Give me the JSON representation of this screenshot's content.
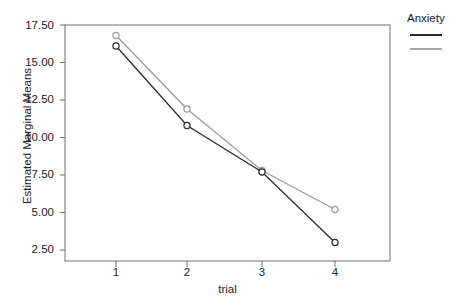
{
  "chart_data": {
    "type": "line",
    "title": "",
    "xlabel": "trial",
    "ylabel": "Estimated Marginal Means",
    "categories": [
      "1",
      "2",
      "3",
      "4"
    ],
    "x": [
      1,
      2,
      3,
      4
    ],
    "xlim": [
      0.55,
      4.45
    ],
    "ylim": [
      1.9,
      18.1
    ],
    "xticks": [
      "1",
      "2",
      "3",
      "4"
    ],
    "yticks": [
      "2.50",
      "5.00",
      "7.50",
      "10.00",
      "12.50",
      "15.00",
      "17.50"
    ],
    "ytick_values": [
      2.5,
      5.0,
      7.5,
      10.0,
      12.5,
      15.0,
      17.5
    ],
    "grid": false,
    "legend_position": "right",
    "legend_title": "Anxiety",
    "markers": "open-circle",
    "series": [
      {
        "name": "",
        "color": "#2b2b2b",
        "values": [
          16.1,
          10.8,
          7.7,
          3.0
        ]
      },
      {
        "name": "",
        "color": "#9a9a9a",
        "values": [
          16.8,
          11.9,
          7.8,
          5.2
        ]
      }
    ]
  },
  "figure": {
    "clipped_title": "",
    "frame_color": "#6e6e6e",
    "background": "#ffffff"
  },
  "legend": {
    "title": "Anxiety",
    "entries": [
      {
        "label": "",
        "color": "#2b2b2b"
      },
      {
        "label": "",
        "color": "#a8a8a8"
      }
    ]
  }
}
